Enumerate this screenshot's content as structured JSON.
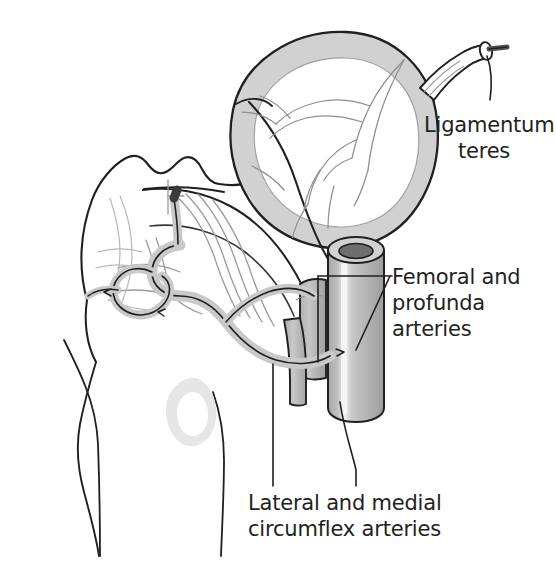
{
  "figure": {
    "background_color": "#ffffff",
    "line_color": "#231f20",
    "text_color": "#231f20"
  },
  "labels": [
    {
      "id": "ligamentum-teres",
      "text": "Ligamentum\nteres",
      "line1": "Ligamentum",
      "line2": "teres",
      "align": "center"
    },
    {
      "id": "femoral-profunda",
      "text": "Femoral and\nprofunda\narteries",
      "line1": "Femoral and",
      "line2": "profunda",
      "line3": "arteries",
      "align": "left"
    },
    {
      "id": "circumflex",
      "text": "Lateral and medial\ncircumflex arteries",
      "line1": "Lateral and medial",
      "line2": "circumflex arteries",
      "align": "left"
    }
  ],
  "structures": [
    {
      "id": "femoral-head",
      "name": "femoral head"
    },
    {
      "id": "articular-cartilage",
      "name": "articular cartilage rim",
      "fill": "#cfcfcf"
    },
    {
      "id": "femoral-neck",
      "name": "femoral neck"
    },
    {
      "id": "greater-trochanter",
      "name": "greater trochanter"
    },
    {
      "id": "lesser-trochanter",
      "name": "lesser trochanter"
    },
    {
      "id": "femoral-shaft",
      "name": "femoral shaft"
    },
    {
      "id": "ligamentum-teres-vessel",
      "name": "ligamentum teres with artery"
    },
    {
      "id": "femoral-artery",
      "name": "femoral artery (cut cylinder)",
      "fill": "#b4b4b4",
      "lumen": "#6e6e6e"
    },
    {
      "id": "profunda-artery",
      "name": "profunda femoris artery",
      "fill": "#bdbdbd"
    },
    {
      "id": "lateral-circumflex-artery",
      "name": "lateral circumflex femoral artery"
    },
    {
      "id": "medial-circumflex-artery",
      "name": "medial circumflex femoral artery"
    },
    {
      "id": "retinacular-vessels",
      "name": "retinacular vessels of femoral neck"
    },
    {
      "id": "trochanteric-anastomosis",
      "name": "trochanteric anastomotic ring"
    }
  ],
  "colors": {
    "ink": "#231f20",
    "cartilage_gray": "#cfcfcf",
    "vessel_gray": "#c9c9c9",
    "artery_body": "#b4b4b4",
    "artery_lumen": "#6e6e6e",
    "faint_gray": "#e3e3e3",
    "background": "#ffffff"
  }
}
